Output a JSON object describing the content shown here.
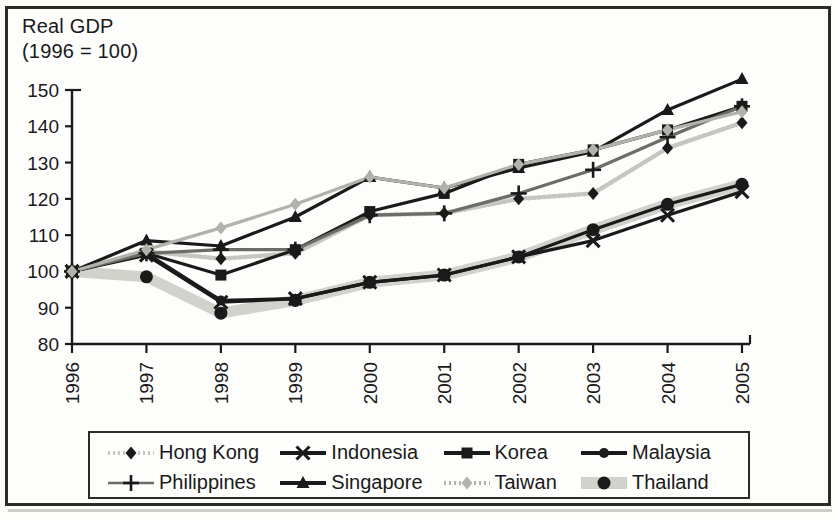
{
  "chart_data": {
    "type": "line",
    "title": "Real GDP\n(1996 = 100)",
    "ylabel": "Real GDP (1996 = 100)",
    "xlabel": "",
    "ylim": [
      80,
      150
    ],
    "yticks": [
      80,
      90,
      100,
      110,
      120,
      130,
      140,
      150
    ],
    "categories": [
      "1996",
      "1997",
      "1998",
      "1999",
      "2000",
      "2001",
      "2002",
      "2003",
      "2004",
      "2005"
    ],
    "x": [
      1996,
      1997,
      1998,
      1999,
      2000,
      2001,
      2002,
      2003,
      2004,
      2005
    ],
    "grid": false,
    "legend_position": "bottom",
    "series": [
      {
        "name": "Hong Kong",
        "marker": "diamond",
        "color": "#1a1a1a",
        "line_color": "#c6c6c0",
        "line_style": "dotted",
        "values": [
          100,
          105.5,
          103.5,
          105,
          115.5,
          116,
          120,
          121.5,
          134,
          141
        ]
      },
      {
        "name": "Indonesia",
        "marker": "x",
        "color": "#1a1a1a",
        "line_color": "#1a1a1a",
        "line_style": "solid",
        "values": [
          100,
          104.5,
          91.5,
          92.5,
          97,
          99,
          104,
          108.5,
          115.5,
          122
        ]
      },
      {
        "name": "Korea",
        "marker": "square",
        "color": "#1a1a1a",
        "line_color": "#1a1a1a",
        "line_style": "solid",
        "values": [
          100,
          105,
          99,
          106,
          116.5,
          121.5,
          129.5,
          133.5,
          139,
          145.5
        ]
      },
      {
        "name": "Malaysia",
        "marker": "circle",
        "color": "#1a1a1a",
        "line_color": "#1a1a1a",
        "line_style": "solid",
        "values": [
          100,
          105,
          92,
          92.5,
          97,
          99,
          104,
          111.5,
          118.5,
          124
        ]
      },
      {
        "name": "Philippines",
        "marker": "plus",
        "color": "#1a1a1a",
        "line_color": "#6d6d68",
        "line_style": "solid",
        "values": [
          100,
          105,
          106,
          106,
          115.5,
          116,
          121.5,
          128,
          137,
          145.5
        ]
      },
      {
        "name": "Singapore",
        "marker": "triangle",
        "color": "#1a1a1a",
        "line_color": "#1a1a1a",
        "line_style": "solid",
        "values": [
          100,
          108.5,
          107,
          115,
          126,
          123,
          128.5,
          133,
          144.5,
          153
        ]
      },
      {
        "name": "Taiwan",
        "marker": "diamond",
        "color": "#b2b2ac",
        "line_color": "#b2b2ac",
        "line_style": "solid",
        "values": [
          100,
          106,
          112,
          118.5,
          126,
          123,
          129.5,
          133.5,
          139,
          144
        ]
      },
      {
        "name": "Thailand",
        "marker": "circle-large",
        "color": "#1a1a1a",
        "line_color": "#d2d2cc",
        "line_style": "thick",
        "values": [
          100,
          98.5,
          88.5,
          92,
          97,
          99,
          104,
          111.5,
          118.5,
          124
        ]
      }
    ]
  },
  "legend": {
    "rows": [
      [
        {
          "label": "Hong Kong",
          "marker": "diamond",
          "style": "dotted-light"
        },
        {
          "label": "Indonesia",
          "marker": "x",
          "style": "solid-dark"
        },
        {
          "label": "Korea",
          "marker": "square",
          "style": "solid-dark"
        },
        {
          "label": "Malaysia",
          "marker": "circle",
          "style": "solid-dark"
        }
      ],
      [
        {
          "label": "Philippines",
          "marker": "plus",
          "style": "solid-gray"
        },
        {
          "label": "Singapore",
          "marker": "triangle",
          "style": "solid-dark"
        },
        {
          "label": "Taiwan",
          "marker": "diamond-gray",
          "style": "dotted-gray"
        },
        {
          "label": "Thailand",
          "marker": "circle-large",
          "style": "thick-gray"
        }
      ]
    ]
  },
  "colors": {
    "ink": "#1a1a1a",
    "gray_line": "#b2b2ac",
    "light_line": "#d2d2cc",
    "mid_line": "#6d6d68",
    "paper": "#fdfdfc"
  }
}
